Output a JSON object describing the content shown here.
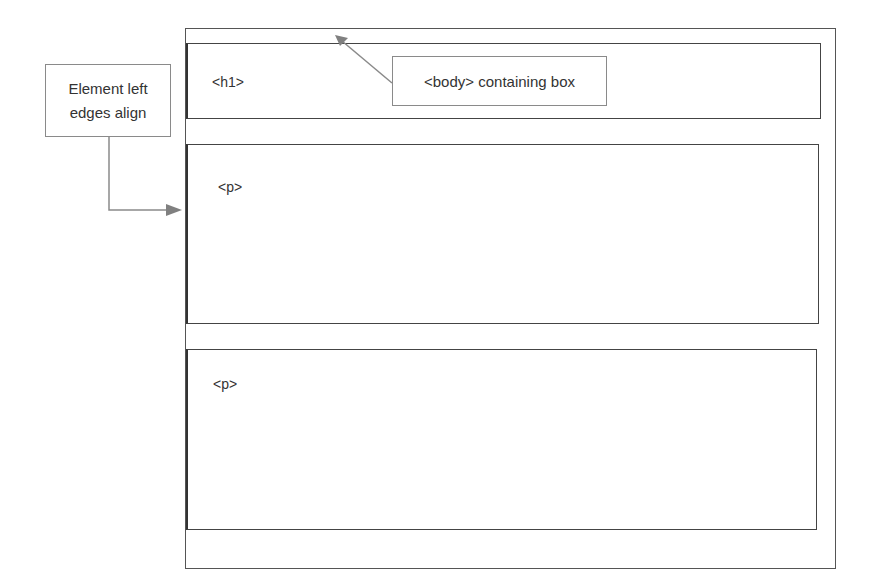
{
  "diagram": {
    "body_box": {
      "label": ""
    },
    "h1_box": {
      "label": "<h1>"
    },
    "p_boxes": [
      {
        "label": "<p>"
      },
      {
        "label": "<p>"
      }
    ],
    "callouts": {
      "left_edges": {
        "text": "Element left edges align"
      },
      "body_container": {
        "text": "<body> containing box"
      }
    },
    "colors": {
      "box_border": "#444444",
      "callout_border": "#8a8a8a",
      "arrow": "#808080",
      "text": "#333333"
    }
  }
}
